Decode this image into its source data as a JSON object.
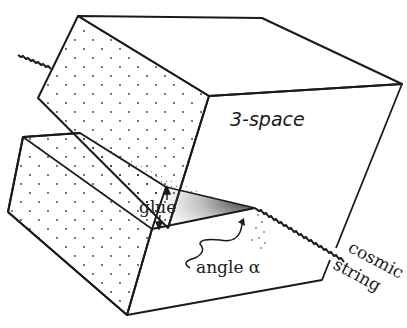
{
  "figure": {
    "labels": {
      "space": "3-space",
      "glue": "glue",
      "angle": "angle α",
      "cosmic": "cosmic",
      "string": "string"
    },
    "colors": {
      "ink": "#1a1a1a",
      "background": "#ffffff"
    }
  }
}
